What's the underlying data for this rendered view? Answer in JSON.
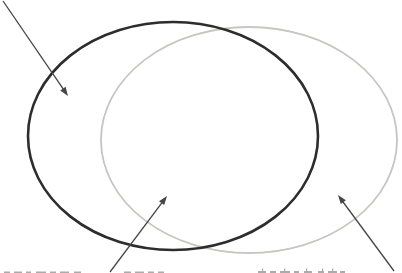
{
  "figure": {
    "kind": "venn-diagram-two-sets",
    "description_of_regions": {
      "left_only": "left-set-only region",
      "intersection": "overlap region of the two sets",
      "right_only": "right-set-only region"
    },
    "arrows": [
      {
        "id": "arrow-left-set",
        "points_to": "left-set-only region"
      },
      {
        "id": "arrow-intersection",
        "points_to": "intersection region"
      },
      {
        "id": "arrow-right-set",
        "points_to": "right-set-only region"
      }
    ],
    "caption_fragments": [
      {
        "position": "bottom-left",
        "legible": false,
        "note": "only top edge of cut-off caption text visible"
      },
      {
        "position": "bottom-right",
        "legible": false,
        "note": "only top edge of cut-off caption text visible"
      }
    ]
  },
  "colors": {
    "background": "#ffffff",
    "set_a_stroke": "#2d2d2d",
    "set_b_stroke": "#c3c5c1",
    "arrow": "#454545",
    "fragment": "#8f8f8f"
  },
  "strokes": {
    "set_a_width": "2.6",
    "set_b_width": "1.8",
    "arrow_width": "1.3"
  }
}
